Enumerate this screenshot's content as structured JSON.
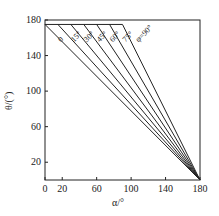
{
  "chart_data": {
    "type": "line",
    "title": "",
    "xlabel": "α/°",
    "ylabel": "θ/(°)",
    "xlim": [
      0,
      180
    ],
    "ylim": [
      0,
      180
    ],
    "x_ticks": [
      "0",
      "20",
      "60",
      "100",
      "140",
      "180"
    ],
    "y_ticks": [
      "20",
      "60",
      "100",
      "140",
      "180"
    ],
    "grid": false,
    "series": [
      {
        "name": "0",
        "x": [
          0,
          180
        ],
        "y": [
          175,
          0
        ]
      },
      {
        "name": "15°",
        "x": [
          15,
          180
        ],
        "y": [
          175,
          0
        ]
      },
      {
        "name": "30°",
        "x": [
          30,
          180
        ],
        "y": [
          175,
          0
        ]
      },
      {
        "name": "45°",
        "x": [
          45,
          180
        ],
        "y": [
          175,
          0
        ]
      },
      {
        "name": "60°",
        "x": [
          60,
          180
        ],
        "y": [
          175,
          0
        ]
      },
      {
        "name": "75°",
        "x": [
          75,
          180
        ],
        "y": [
          175,
          0
        ]
      },
      {
        "name": "φ=90°",
        "x": [
          90,
          180
        ],
        "y": [
          175,
          0
        ]
      }
    ],
    "top_line": {
      "x": [
        0,
        90
      ],
      "y": [
        175,
        175
      ]
    }
  }
}
